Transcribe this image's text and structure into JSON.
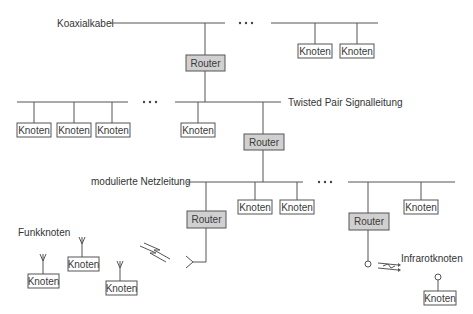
{
  "labels": {
    "koaxialkabel": "Koaxialkabel",
    "twisted_pair": "Twisted Pair Signalleitung",
    "netzleitung": "modulierte Netzleitung",
    "funkknoten": "Funkknoten",
    "infrarotknoten": "Infrarotknoten"
  },
  "router_label": "Router",
  "node_label": "Knoten",
  "colors": {
    "line": "#555555",
    "router_fill": "#d0d0d0",
    "node_fill": "#ffffff",
    "text": "#333333"
  },
  "segments": {
    "coax": {
      "label": "Koaxialkabel",
      "nodes": 2,
      "routers": 1
    },
    "twisted_pair": {
      "label": "Twisted Pair Signalleitung",
      "nodes": 4,
      "routers": 1
    },
    "netzleitung": {
      "label": "modulierte Netzleitung",
      "nodes": 3,
      "routers": 2
    },
    "funk": {
      "label": "Funkknoten",
      "nodes": 3
    },
    "infrarot": {
      "label": "Infrarotknoten",
      "nodes": 1
    }
  }
}
